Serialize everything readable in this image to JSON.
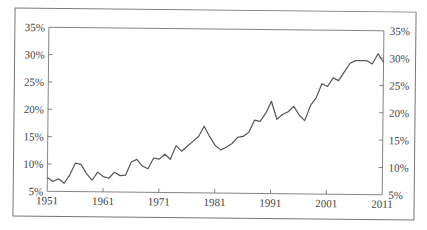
{
  "chart_data": {
    "type": "line",
    "title": "",
    "xlabel": "",
    "ylabel": "",
    "ylim": [
      5,
      35
    ],
    "xlim": [
      1951,
      2011
    ],
    "grid": false,
    "legend": null,
    "x_ticks": [
      "1951",
      "1961",
      "1971",
      "1981",
      "1991",
      "2001",
      "2011"
    ],
    "y_ticks_left": [
      "5%",
      "10%",
      "15%",
      "20%",
      "25%",
      "30%",
      "35%"
    ],
    "y_ticks_right": [
      "5%",
      "10%",
      "15%",
      "20%",
      "25%",
      "30%",
      "35%"
    ],
    "x": [
      1951,
      1952,
      1953,
      1954,
      1955,
      1956,
      1957,
      1958,
      1959,
      1960,
      1961,
      1962,
      1963,
      1964,
      1965,
      1966,
      1967,
      1968,
      1969,
      1970,
      1971,
      1972,
      1973,
      1974,
      1975,
      1976,
      1977,
      1978,
      1979,
      1980,
      1981,
      1982,
      1983,
      1984,
      1985,
      1986,
      1987,
      1988,
      1989,
      1990,
      1991,
      1992,
      1993,
      1994,
      1995,
      1996,
      1997,
      1998,
      1999,
      2000,
      2001,
      2002,
      2003,
      2004,
      2005,
      2006,
      2007,
      2008,
      2009,
      2010,
      2011
    ],
    "series": [
      {
        "name": "series",
        "color": "#555555",
        "values": [
          7.5,
          6.8,
          7.3,
          6.5,
          8.0,
          10.2,
          10.0,
          8.3,
          7.1,
          8.6,
          7.8,
          7.5,
          8.6,
          8.0,
          8.1,
          10.5,
          11.0,
          9.8,
          9.3,
          11.3,
          11.1,
          12.0,
          11.1,
          13.6,
          12.6,
          13.5,
          14.4,
          15.3,
          17.2,
          15.3,
          13.7,
          12.9,
          13.4,
          14.1,
          15.2,
          15.4,
          16.2,
          18.4,
          18.2,
          19.7,
          21.9,
          18.6,
          19.5,
          20.0,
          21.0,
          19.4,
          18.4,
          21.2,
          22.6,
          25.2,
          24.7,
          26.3,
          25.8,
          27.4,
          29.0,
          29.5,
          29.5,
          29.5,
          28.9,
          30.8,
          29.2
        ]
      }
    ]
  },
  "colors": {
    "line": "#555555",
    "axis": "#666666",
    "frame": "#777777",
    "text": "#444444"
  }
}
